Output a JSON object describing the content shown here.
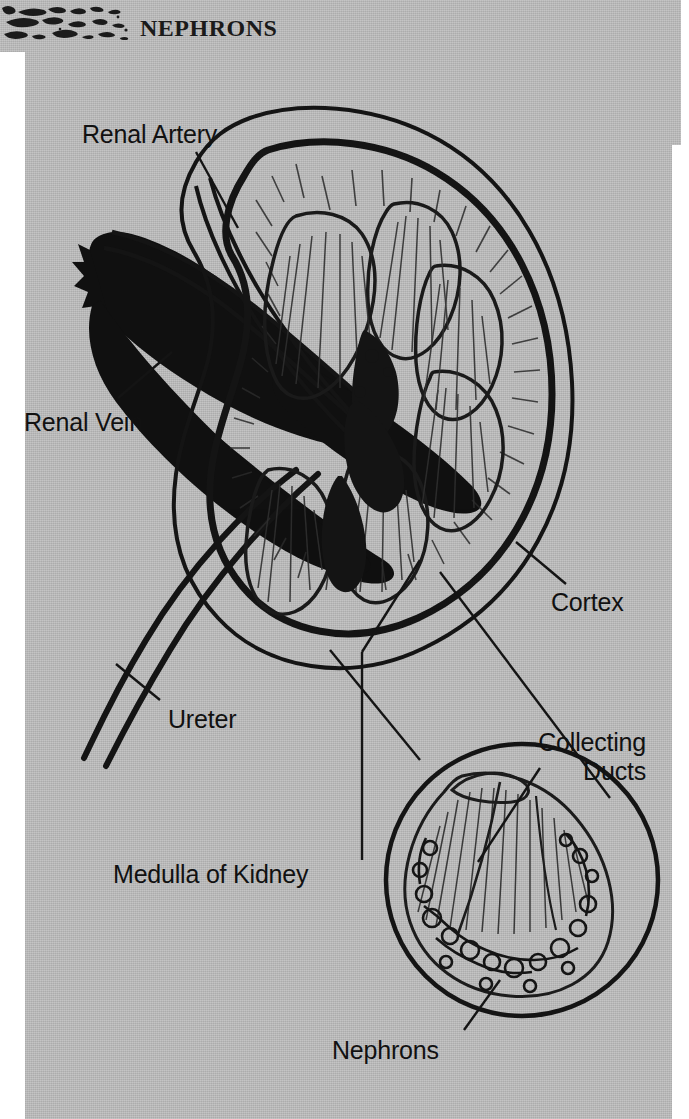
{
  "page": {
    "width": 689,
    "height": 1119,
    "background_color": "#b8b8b8",
    "ink_color": "#111111",
    "paper_color": "#ffffff"
  },
  "header": {
    "title": "Nephrons",
    "decoration_icon": "brush-texture-ornament"
  },
  "figure": {
    "labels": [
      {
        "id": "renal-artery",
        "text": "Renal Artery",
        "x": 82,
        "y": 120
      },
      {
        "id": "renal-vein",
        "text": "Renal Vein",
        "x": 24,
        "y": 408
      },
      {
        "id": "ureter",
        "text": "Ureter",
        "x": 168,
        "y": 705
      },
      {
        "id": "cortex",
        "text": "Cortex",
        "x": 551,
        "y": 588
      },
      {
        "id": "collecting-ducts",
        "text": "Collecting\nDucts",
        "x": 546,
        "y": 728
      },
      {
        "id": "medulla",
        "text": "Medulla of Kidney",
        "x": 113,
        "y": 860
      },
      {
        "id": "nephrons",
        "text": "Nephrons",
        "x": 332,
        "y": 1036
      }
    ],
    "parts": [
      {
        "id": "renal-artery-vessel",
        "name": "renal-artery-vessel"
      },
      {
        "id": "renal-vein-vessel",
        "name": "renal-vein-vessel"
      },
      {
        "id": "ureter-tube",
        "name": "ureter-tube"
      },
      {
        "id": "renal-capsule",
        "name": "renal-capsule-outline"
      },
      {
        "id": "cortex-region",
        "name": "cortex-region"
      },
      {
        "id": "medulla-pyramids",
        "name": "medulla-renal-pyramids"
      },
      {
        "id": "renal-pelvis",
        "name": "renal-pelvis"
      },
      {
        "id": "detail-circle",
        "name": "nephron-magnification-circle"
      },
      {
        "id": "collecting-duct-striations",
        "name": "collecting-duct-striations"
      },
      {
        "id": "nephron-tangle",
        "name": "nephron-tubule-cluster"
      }
    ]
  }
}
